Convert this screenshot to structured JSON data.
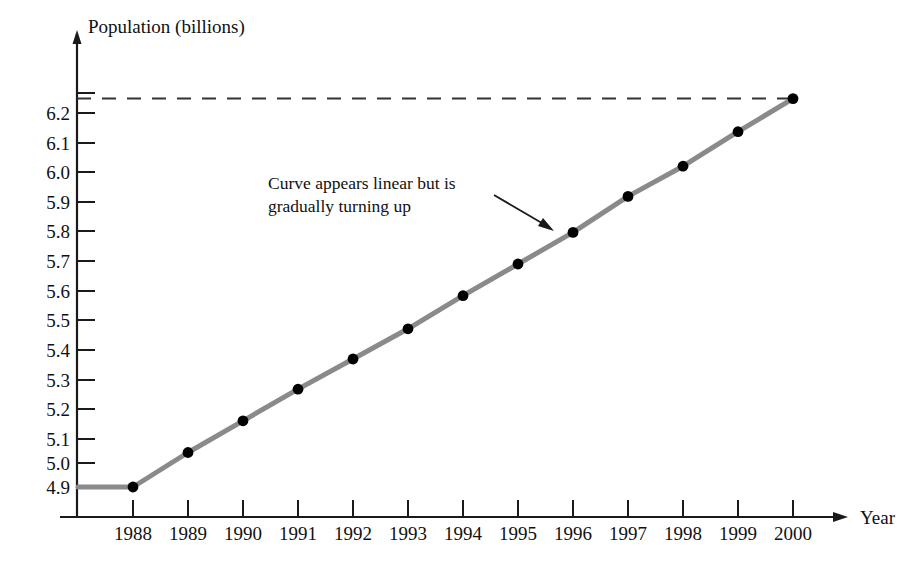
{
  "chart_data": {
    "type": "line",
    "title": "",
    "xlabel": "Year",
    "ylabel": "Population (billions)",
    "categories": [
      "1988",
      "1989",
      "1990",
      "1991",
      "1992",
      "1993",
      "1994",
      "1995",
      "1996",
      "1997",
      "1998",
      "1999",
      "2000"
    ],
    "values": [
      4.9,
      5.02,
      5.13,
      5.24,
      5.345,
      5.45,
      5.565,
      5.675,
      5.785,
      5.91,
      6.015,
      6.135,
      6.25
    ],
    "series": [
      {
        "name": "World population",
        "values": [
          4.9,
          5.02,
          5.13,
          5.24,
          5.345,
          5.45,
          5.565,
          5.675,
          5.785,
          5.91,
          6.015,
          6.135,
          6.25
        ]
      }
    ],
    "ytick_labels": [
      "6.2",
      "6.1",
      "6.0",
      "5.9",
      "5.8",
      "5.7",
      "5.6",
      "5.5",
      "5.4",
      "5.3",
      "5.2",
      "5.1",
      "5.0",
      "4.9"
    ],
    "ytick_values": [
      6.2,
      6.1,
      6.0,
      5.9,
      5.8,
      5.7,
      5.6,
      5.5,
      5.4,
      5.3,
      5.2,
      5.1,
      5.0,
      4.9
    ],
    "ylim": [
      4.855,
      6.27
    ],
    "xlim": [
      "1987.0",
      "2000.6"
    ],
    "grid": false,
    "legend": "none",
    "reference_line": {
      "type": "dashed-horizontal",
      "value": 6.25,
      "label": ""
    },
    "annotations": [
      {
        "text_line1": "Curve appears linear but is",
        "text_line2": "gradually turning up",
        "points_to_year": "1996",
        "points_to_value": 5.785
      }
    ]
  },
  "axes": {
    "y_axis_title": "Population (billions)",
    "x_axis_title": "Year"
  }
}
